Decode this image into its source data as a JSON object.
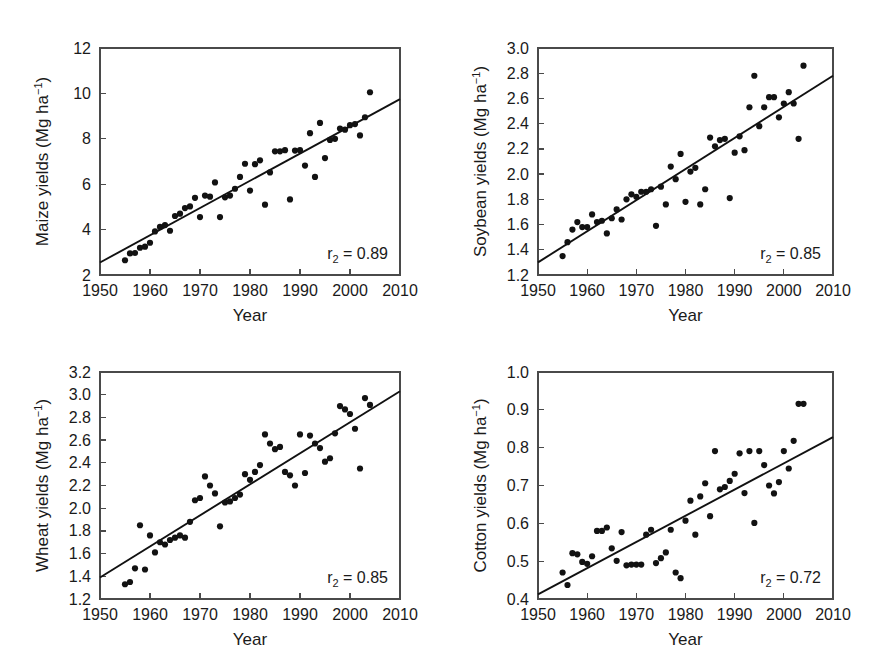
{
  "figure": {
    "background": "#ffffff",
    "marker_color": "#121212",
    "line_color": "#111111",
    "axis_color": "#4a4a4a",
    "panel_count": 4
  },
  "chart_data": [
    {
      "id": "maize",
      "type": "scatter",
      "title": "",
      "xlabel": "Year",
      "ylabel": "Maize yields (Mg ha",
      "ylabel_sup": "−1",
      "ylabel_tail": ")",
      "xlim": [
        1950,
        2010
      ],
      "ylim": [
        2,
        12
      ],
      "xticks": [
        1950,
        1960,
        1970,
        1980,
        1990,
        2000,
        2010
      ],
      "yticks": [
        2,
        4,
        6,
        8,
        10,
        12
      ],
      "xticklabels": [
        "1950",
        "1960",
        "1970",
        "1980",
        "1990",
        "2000",
        "2010"
      ],
      "yticklabels": [
        "2",
        "4",
        "6",
        "8",
        "10",
        "12"
      ],
      "grid": false,
      "legend": "none",
      "annotation": "r2 = 0.89",
      "annotation_prefix": "r",
      "annotation_sub": "2",
      "annotation_suffix": " = 0.89",
      "r_squared": 0.89,
      "trendline": {
        "x": [
          1950,
          2010
        ],
        "y": [
          2.55,
          9.75
        ]
      },
      "x": [
        1955,
        1956,
        1957,
        1958,
        1959,
        1960,
        1961,
        1962,
        1963,
        1964,
        1965,
        1966,
        1967,
        1968,
        1969,
        1970,
        1971,
        1972,
        1973,
        1974,
        1975,
        1976,
        1977,
        1978,
        1979,
        1980,
        1981,
        1982,
        1983,
        1984,
        1985,
        1986,
        1987,
        1988,
        1989,
        1990,
        1991,
        1992,
        1993,
        1994,
        1995,
        1996,
        1997,
        1998,
        1999,
        2000,
        2001,
        2002,
        2003,
        2004
      ],
      "y": [
        2.65,
        2.95,
        2.97,
        3.2,
        3.25,
        3.42,
        3.92,
        4.12,
        4.2,
        3.95,
        4.6,
        4.7,
        4.95,
        5.02,
        5.4,
        4.55,
        5.5,
        5.45,
        6.08,
        4.55,
        5.42,
        5.5,
        5.8,
        6.32,
        6.9,
        5.72,
        6.88,
        7.05,
        5.1,
        6.52,
        7.45,
        7.45,
        7.5,
        5.33,
        7.48,
        7.5,
        6.82,
        8.25,
        6.32,
        8.7,
        7.15,
        7.95,
        8.0,
        8.45,
        8.4,
        8.6,
        8.65,
        8.15,
        8.95,
        10.05
      ]
    },
    {
      "id": "soybean",
      "type": "scatter",
      "title": "",
      "xlabel": "Year",
      "ylabel": "Soybean yields (Mg ha",
      "ylabel_sup": "−1",
      "ylabel_tail": ")",
      "xlim": [
        1950,
        2010
      ],
      "ylim": [
        1.2,
        3.0
      ],
      "xticks": [
        1950,
        1960,
        1970,
        1980,
        1990,
        2000,
        2010
      ],
      "yticks": [
        1.2,
        1.4,
        1.6,
        1.8,
        2.0,
        2.2,
        2.4,
        2.6,
        2.8,
        3.0
      ],
      "xticklabels": [
        "1950",
        "1960",
        "1970",
        "1980",
        "1990",
        "2000",
        "2010"
      ],
      "yticklabels": [
        "1.2",
        "1.4",
        "1.6",
        "1.8",
        "2.0",
        "2.2",
        "2.4",
        "2.6",
        "2.8",
        "3.0"
      ],
      "grid": false,
      "legend": "none",
      "annotation": "r2 = 0.85",
      "annotation_prefix": "r",
      "annotation_sub": "2",
      "annotation_suffix": " = 0.85",
      "r_squared": 0.85,
      "trendline": {
        "x": [
          1950,
          2010
        ],
        "y": [
          1.3,
          2.78
        ]
      },
      "x": [
        1955,
        1956,
        1957,
        1958,
        1959,
        1960,
        1961,
        1962,
        1963,
        1964,
        1965,
        1966,
        1967,
        1968,
        1969,
        1970,
        1971,
        1972,
        1973,
        1974,
        1975,
        1976,
        1977,
        1978,
        1979,
        1980,
        1981,
        1982,
        1983,
        1984,
        1985,
        1986,
        1987,
        1988,
        1989,
        1990,
        1991,
        1992,
        1993,
        1994,
        1995,
        1996,
        1997,
        1998,
        1999,
        2000,
        2001,
        2002,
        2003,
        2004
      ],
      "y": [
        1.35,
        1.46,
        1.56,
        1.62,
        1.58,
        1.58,
        1.68,
        1.62,
        1.63,
        1.53,
        1.65,
        1.72,
        1.64,
        1.8,
        1.84,
        1.82,
        1.86,
        1.86,
        1.88,
        1.59,
        1.9,
        1.76,
        2.06,
        1.96,
        2.16,
        1.78,
        2.02,
        2.05,
        1.76,
        1.88,
        2.29,
        2.22,
        2.27,
        2.28,
        1.81,
        2.17,
        2.3,
        2.19,
        2.53,
        2.78,
        2.38,
        2.53,
        2.61,
        2.61,
        2.45,
        2.56,
        2.65,
        2.56,
        2.28,
        2.86
      ]
    },
    {
      "id": "wheat",
      "type": "scatter",
      "title": "",
      "xlabel": "Year",
      "ylabel": "Wheat yields (Mg ha",
      "ylabel_sup": "−1",
      "ylabel_tail": ")",
      "xlim": [
        1950,
        2010
      ],
      "ylim": [
        1.2,
        3.2
      ],
      "xticks": [
        1950,
        1960,
        1970,
        1980,
        1990,
        2000,
        2010
      ],
      "yticks": [
        1.2,
        1.4,
        1.6,
        1.8,
        2.0,
        2.2,
        2.4,
        2.6,
        2.8,
        3.0,
        3.2
      ],
      "xticklabels": [
        "1950",
        "1960",
        "1970",
        "1980",
        "1990",
        "2000",
        "2010"
      ],
      "yticklabels": [
        "1.2",
        "1.4",
        "1.6",
        "1.8",
        "2.0",
        "2.2",
        "2.4",
        "2.6",
        "2.8",
        "3.0",
        "3.2"
      ],
      "grid": false,
      "legend": "none",
      "annotation": "r2 = 0.85",
      "annotation_prefix": "r",
      "annotation_sub": "2",
      "annotation_suffix": " = 0.85",
      "r_squared": 0.85,
      "trendline": {
        "x": [
          1950,
          2010
        ],
        "y": [
          1.39,
          3.03
        ]
      },
      "x": [
        1955,
        1956,
        1957,
        1958,
        1959,
        1960,
        1961,
        1962,
        1963,
        1964,
        1965,
        1966,
        1967,
        1968,
        1969,
        1970,
        1971,
        1972,
        1973,
        1974,
        1975,
        1976,
        1977,
        1978,
        1979,
        1980,
        1981,
        1982,
        1983,
        1984,
        1985,
        1986,
        1987,
        1988,
        1989,
        1990,
        1991,
        1992,
        1993,
        1994,
        1995,
        1996,
        1997,
        1998,
        1999,
        2000,
        2001,
        2002,
        2003,
        2004
      ],
      "y": [
        1.33,
        1.35,
        1.47,
        1.85,
        1.46,
        1.76,
        1.61,
        1.7,
        1.68,
        1.72,
        1.74,
        1.76,
        1.74,
        1.88,
        2.07,
        2.09,
        2.28,
        2.2,
        2.13,
        1.84,
        2.05,
        2.06,
        2.09,
        2.12,
        2.3,
        2.25,
        2.32,
        2.38,
        2.65,
        2.57,
        2.52,
        2.54,
        2.32,
        2.29,
        2.2,
        2.65,
        2.31,
        2.64,
        2.57,
        2.53,
        2.41,
        2.44,
        2.66,
        2.9,
        2.87,
        2.83,
        2.7,
        2.35,
        2.97,
        2.91
      ]
    },
    {
      "id": "cotton",
      "type": "scatter",
      "title": "",
      "xlabel": "Year",
      "ylabel": "Cotton yields (Mg ha",
      "ylabel_sup": "−1",
      "ylabel_tail": ")",
      "xlim": [
        1950,
        2010
      ],
      "ylim": [
        0.4,
        1.0
      ],
      "xticks": [
        1950,
        1960,
        1970,
        1980,
        1990,
        2000,
        2010
      ],
      "yticks": [
        0.4,
        0.5,
        0.6,
        0.7,
        0.8,
        0.9,
        1.0
      ],
      "xticklabels": [
        "1950",
        "1960",
        "1970",
        "1980",
        "1990",
        "2000",
        "2010"
      ],
      "yticklabels": [
        "0.4",
        "0.5",
        "0.6",
        "0.7",
        "0.8",
        "0.9",
        "1.0"
      ],
      "grid": false,
      "legend": "none",
      "annotation": "r2 = 0.72",
      "annotation_prefix": "r",
      "annotation_sub": "2",
      "annotation_suffix": " = 0.72",
      "r_squared": 0.72,
      "trendline": {
        "x": [
          1950,
          2010
        ],
        "y": [
          0.412,
          0.828
        ]
      },
      "x": [
        1955,
        1956,
        1957,
        1958,
        1959,
        1960,
        1961,
        1962,
        1963,
        1964,
        1965,
        1966,
        1967,
        1968,
        1969,
        1970,
        1971,
        1972,
        1973,
        1974,
        1975,
        1976,
        1977,
        1978,
        1979,
        1980,
        1981,
        1982,
        1983,
        1984,
        1985,
        1986,
        1987,
        1988,
        1989,
        1990,
        1991,
        1992,
        1993,
        1994,
        1995,
        1996,
        1997,
        1998,
        1999,
        2000,
        2001,
        2002,
        2003,
        2004
      ],
      "y": [
        0.47,
        0.437,
        0.521,
        0.518,
        0.498,
        0.493,
        0.513,
        0.58,
        0.58,
        0.589,
        0.534,
        0.501,
        0.577,
        0.489,
        0.491,
        0.491,
        0.491,
        0.57,
        0.583,
        0.495,
        0.508,
        0.523,
        0.583,
        0.47,
        0.455,
        0.607,
        0.66,
        0.57,
        0.671,
        0.706,
        0.619,
        0.791,
        0.69,
        0.696,
        0.712,
        0.731,
        0.785,
        0.68,
        0.791,
        0.601,
        0.791,
        0.754,
        0.7,
        0.679,
        0.709,
        0.791,
        0.745,
        0.818,
        0.916,
        0.916
      ]
    }
  ]
}
